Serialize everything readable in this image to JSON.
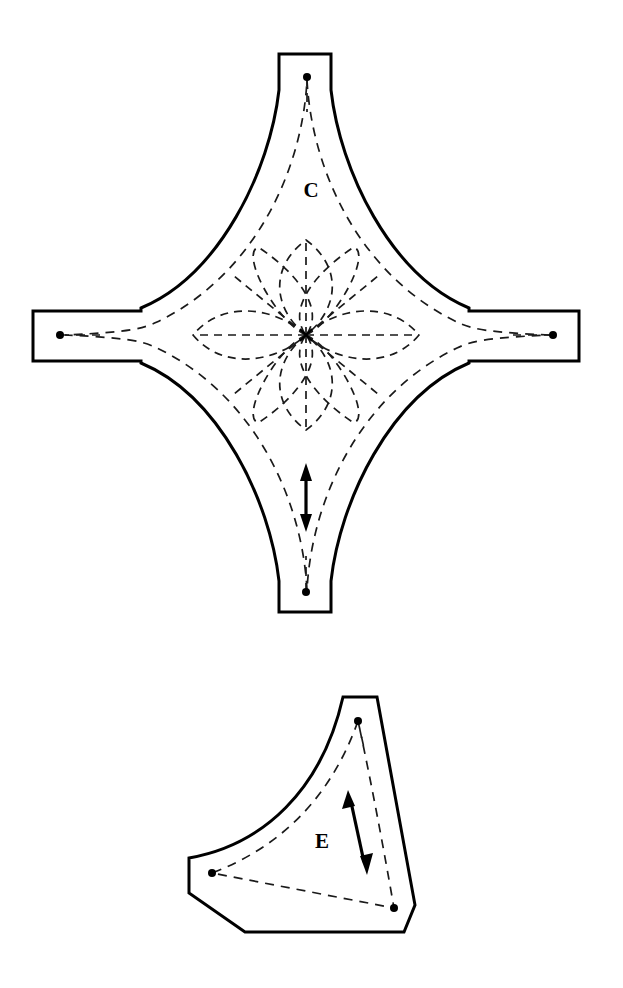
{
  "document": {
    "kind": "sewing-pattern-template-sheet",
    "background_color": "#ffffff",
    "ink_color": "#000000",
    "width": 623,
    "height": 988
  },
  "pieces": [
    {
      "id": "piece-c",
      "label": "C",
      "label_x": 311,
      "label_y": 192,
      "shape": "four-pointed concave star with rectangular seam tabs",
      "center": {
        "x": 306,
        "y": 335
      },
      "registration_dots": [
        {
          "name": "top-dot",
          "x": 307,
          "y": 77
        },
        {
          "name": "left-dot",
          "x": 60,
          "y": 335
        },
        {
          "name": "right-dot",
          "x": 553,
          "y": 335
        },
        {
          "name": "bottom-dot",
          "x": 306,
          "y": 592
        }
      ],
      "tabs": [
        {
          "name": "top-tab",
          "x": 279,
          "y": 54,
          "width": 52,
          "height": 36
        },
        {
          "name": "left-tab",
          "x": 33,
          "y": 311,
          "width": 36,
          "height": 50
        },
        {
          "name": "right-tab",
          "x": 543,
          "y": 311,
          "width": 36,
          "height": 50
        },
        {
          "name": "bottom-tab",
          "x": 279,
          "y": 576,
          "width": 52,
          "height": 36
        }
      ],
      "grain_arrow": {
        "name": "vertical-double-arrow",
        "x1": 306,
        "y1": 468,
        "x2": 306,
        "y2": 527,
        "double_headed": true,
        "orientation": "vertical"
      },
      "motif": {
        "name": "eight-petal-flower",
        "petal_count": 8,
        "center_x": 306,
        "center_y": 335
      }
    },
    {
      "id": "piece-e",
      "label": "E",
      "label_x": 322,
      "label_y": 843,
      "shape": "curved triangular wedge with chamfered corners",
      "registration_dots": [
        {
          "name": "apex-dot",
          "x": 358,
          "y": 721
        },
        {
          "name": "left-dot",
          "x": 212,
          "y": 873
        },
        {
          "name": "bottom-right-dot",
          "x": 394,
          "y": 908
        }
      ],
      "grain_arrow": {
        "name": "diagonal-double-arrow",
        "x1": 348,
        "y1": 793,
        "x2": 367,
        "y2": 872,
        "double_headed": true,
        "orientation": "diagonal"
      }
    }
  ]
}
